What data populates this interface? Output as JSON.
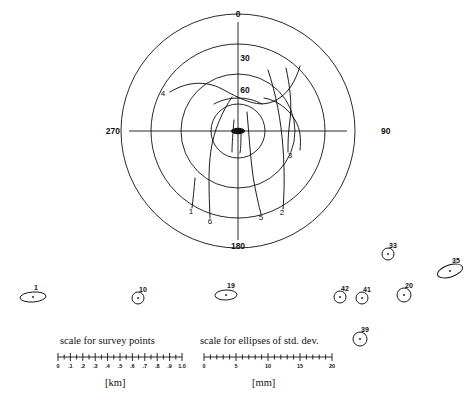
{
  "figure": {
    "type": "polar-deformation-plot",
    "background": "#ffffff",
    "ink": "#111111"
  },
  "polar": {
    "center": {
      "x": 238,
      "y": 131
    },
    "rings": [
      27,
      57,
      87,
      117
    ],
    "axis_labels": [
      {
        "name": "polar-label-0",
        "text": "0",
        "x": 238,
        "y": 14
      },
      {
        "name": "polar-label-30",
        "text": "30",
        "x": 245,
        "y": 58
      },
      {
        "name": "polar-label-60",
        "text": "60",
        "x": 245,
        "y": 90
      },
      {
        "name": "polar-label-90",
        "text": "90",
        "x": 381,
        "y": 131
      },
      {
        "name": "polar-label-180",
        "text": "180",
        "x": 238,
        "y": 246
      },
      {
        "name": "polar-label-270",
        "text": "270",
        "x": 120,
        "y": 131
      }
    ],
    "curve_labels": [
      {
        "name": "curve-label-4",
        "text": "4",
        "x": 163,
        "y": 94
      },
      {
        "name": "curve-label-3",
        "text": "3",
        "x": 290,
        "y": 156
      },
      {
        "name": "curve-label-1",
        "text": "1",
        "x": 191,
        "y": 212
      },
      {
        "name": "curve-label-6",
        "text": "6",
        "x": 210,
        "y": 222
      },
      {
        "name": "curve-label-5",
        "text": "5",
        "x": 261,
        "y": 218
      },
      {
        "name": "curve-label-2",
        "text": "2",
        "x": 282,
        "y": 213
      }
    ]
  },
  "ellipses": [
    {
      "name": "ellipse-marker-1",
      "label": "1",
      "cx": 33,
      "cy": 297,
      "rx": 13,
      "ry": 5,
      "rot": -4,
      "label_dx": 3,
      "label_dy": -10
    },
    {
      "name": "ellipse-marker-10",
      "label": "10",
      "cx": 138,
      "cy": 298,
      "rx": 6,
      "ry": 6,
      "rot": 0,
      "label_dx": 5,
      "label_dy": -9
    },
    {
      "name": "ellipse-marker-19",
      "label": "19",
      "cx": 226,
      "cy": 295,
      "rx": 11,
      "ry": 5,
      "rot": -2,
      "label_dx": 5,
      "label_dy": -10
    },
    {
      "name": "ellipse-marker-42",
      "label": "42",
      "cx": 340,
      "cy": 297,
      "rx": 6,
      "ry": 6,
      "rot": 0,
      "label_dx": 5,
      "label_dy": -9
    },
    {
      "name": "ellipse-marker-41",
      "label": "41",
      "cx": 362,
      "cy": 298,
      "rx": 6,
      "ry": 6,
      "rot": 0,
      "label_dx": 5,
      "label_dy": -9
    },
    {
      "name": "ellipse-marker-20",
      "label": "20",
      "cx": 404,
      "cy": 295,
      "rx": 7,
      "ry": 7,
      "rot": 0,
      "label_dx": 5,
      "label_dy": -10
    },
    {
      "name": "ellipse-marker-33",
      "label": "33",
      "cx": 388,
      "cy": 254,
      "rx": 6,
      "ry": 6,
      "rot": 0,
      "label_dx": 5,
      "label_dy": -9
    },
    {
      "name": "ellipse-marker-35",
      "label": "35",
      "cx": 450,
      "cy": 271,
      "rx": 13,
      "ry": 6,
      "rot": -18,
      "label_dx": 6,
      "label_dy": -11
    },
    {
      "name": "ellipse-marker-39",
      "label": "39",
      "cx": 360,
      "cy": 339,
      "rx": 7,
      "ry": 7,
      "rot": 0,
      "label_dx": 5,
      "label_dy": -10
    }
  ],
  "scales": [
    {
      "name": "scale-survey-points",
      "title": "scale for survey points",
      "unit": "[km]",
      "title_x": 60,
      "title_y": 335,
      "bar_x": 58,
      "bar_y": 357,
      "bar_w": 124,
      "unit_x": 105,
      "unit_y": 377,
      "ticks": [
        "0",
        ".1",
        ".2",
        ".3",
        ".4",
        ".5",
        ".6",
        ".7",
        ".8",
        ".9",
        "1.0"
      ],
      "minor_per_major": 1
    },
    {
      "name": "scale-std-dev-ellipses",
      "title": "scale for ellipses of std. dev.",
      "unit": "[mm]",
      "title_x": 200,
      "title_y": 335,
      "bar_x": 204,
      "bar_y": 357,
      "bar_w": 128,
      "unit_x": 252,
      "unit_y": 377,
      "ticks": [
        "0",
        "5",
        "10",
        "15",
        "20"
      ],
      "minor_per_major": 5
    }
  ]
}
